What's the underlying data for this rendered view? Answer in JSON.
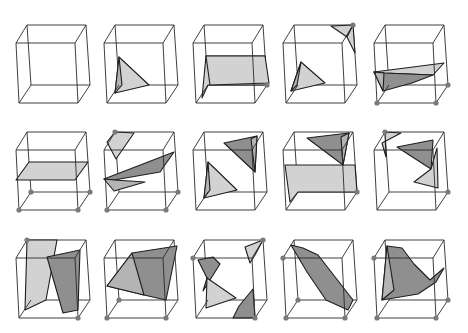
{
  "figure": {
    "rows": 3,
    "cols": 5,
    "colors": {
      "edge": "#2a2a2a",
      "light_fill": "#d2d2d2",
      "mid_fill": "#b4b4b4",
      "dark_fill": "#8f8f8f",
      "vertex_dot": "#7a7a7a",
      "background": "#ffffff"
    },
    "col_x": [
      16,
      104,
      193,
      283,
      374
    ],
    "row_y": [
      25,
      132,
      240
    ],
    "cube_vertices_local": {
      "BTL": [
        11,
        0
      ],
      "BTR": [
        70,
        0
      ],
      "FTL": [
        0,
        18
      ],
      "FTR": [
        59,
        18
      ],
      "BBL": [
        15,
        60
      ],
      "BBR": [
        74,
        60
      ],
      "FBL": [
        3,
        78
      ],
      "FBR": [
        62,
        78
      ]
    },
    "cases": [
      {
        "id": 0,
        "marked": [],
        "polys": []
      },
      {
        "id": 1,
        "marked": [],
        "polys": [
          {
            "shade": "light",
            "pts": [
              [
                15,
                32
              ],
              [
                11,
                68
              ],
              [
                45,
                60
              ]
            ]
          },
          {
            "shade": "mid",
            "pts": [
              [
                15,
                32
              ],
              [
                11,
                68
              ],
              [
                18,
                60
              ]
            ]
          }
        ]
      },
      {
        "id": 2,
        "marked": [
          "BBR"
        ],
        "polys": [
          {
            "shade": "light",
            "pts": [
              [
                13,
                31
              ],
              [
                72,
                31
              ],
              [
                74,
                60
              ],
              [
                15,
                60
              ],
              [
                9,
                73
              ],
              [
                13,
                31
              ]
            ]
          },
          {
            "shade": "light",
            "pts": [
              [
                13,
                31
              ],
              [
                72,
                31
              ],
              [
                76,
                58
              ],
              [
                17,
                60
              ]
            ]
          }
        ]
      },
      {
        "id": 3,
        "marked": [
          "BTR"
        ],
        "polys": [
          {
            "shade": "light",
            "pts": [
              [
                18,
                37
              ],
              [
                8,
                66
              ],
              [
                42,
                58
              ]
            ]
          },
          {
            "shade": "mid",
            "pts": [
              [
                18,
                37
              ],
              [
                8,
                66
              ],
              [
                14,
                60
              ]
            ]
          },
          {
            "shade": "light",
            "pts": [
              [
                48,
                1
              ],
              [
                70,
                0
              ],
              [
                64,
                12
              ]
            ]
          },
          {
            "shade": "light",
            "pts": [
              [
                64,
                12
              ],
              [
                70,
                0
              ],
              [
                72,
                28
              ]
            ]
          }
        ]
      },
      {
        "id": 4,
        "marked": [
          "FBL",
          "FBR",
          "BBR"
        ],
        "polys": [
          {
            "shade": "light",
            "pts": [
              [
                0,
                47
              ],
              [
                70,
                38
              ],
              [
                59,
                50
              ],
              [
                10,
                48
              ]
            ]
          },
          {
            "shade": "dark",
            "pts": [
              [
                0,
                47
              ],
              [
                10,
                48
              ],
              [
                59,
                50
              ],
              [
                38,
                58
              ],
              [
                9,
                66
              ]
            ]
          },
          {
            "shade": "mid",
            "pts": [
              [
                0,
                47
              ],
              [
                10,
                48
              ],
              [
                9,
                66
              ]
            ]
          }
        ]
      },
      {
        "id": 5,
        "marked": [
          "FBL",
          "FBR",
          "BBL",
          "BBR"
        ],
        "polys": [
          {
            "shade": "light",
            "pts": [
              [
                0,
                48
              ],
              [
                13,
                30
              ],
              [
                72,
                30
              ],
              [
                59,
                48
              ]
            ]
          }
        ]
      },
      {
        "id": 6,
        "marked": [
          "BTL",
          "FBL",
          "FBR",
          "BBR"
        ],
        "polys": [
          {
            "shade": "light",
            "pts": [
              [
                11,
                0
              ],
              [
                3,
                10
              ],
              [
                12,
                27
              ],
              [
                30,
                1
              ]
            ]
          },
          {
            "shade": "dark",
            "pts": [
              [
                0,
                47
              ],
              [
                70,
                20
              ],
              [
                56,
                40
              ],
              [
                10,
                48
              ]
            ]
          },
          {
            "shade": "mid",
            "pts": [
              [
                0,
                47
              ],
              [
                10,
                48
              ],
              [
                41,
                50
              ],
              [
                10,
                59
              ]
            ]
          }
        ]
      },
      {
        "id": 7,
        "marked": [],
        "polys": [
          {
            "shade": "light",
            "pts": [
              [
                15,
                30
              ],
              [
                11,
                66
              ],
              [
                44,
                58
              ]
            ]
          },
          {
            "shade": "mid",
            "pts": [
              [
                15,
                30
              ],
              [
                11,
                66
              ],
              [
                17,
                58
              ]
            ]
          },
          {
            "shade": "dark",
            "pts": [
              [
                31,
                11
              ],
              [
                64,
                4
              ],
              [
                62,
                40
              ]
            ]
          },
          {
            "shade": "mid",
            "pts": [
              [
                58,
                7
              ],
              [
                64,
                4
              ],
              [
                62,
                40
              ]
            ]
          }
        ]
      },
      {
        "id": 8,
        "marked": [
          "BBR"
        ],
        "polys": [
          {
            "shade": "light",
            "pts": [
              [
                2,
                33
              ],
              [
                72,
                33
              ],
              [
                74,
                60
              ],
              [
                15,
                60
              ],
              [
                7,
                70
              ]
            ]
          },
          {
            "shade": "dark",
            "pts": [
              [
                24,
                6
              ],
              [
                66,
                1
              ],
              [
                60,
                33
              ]
            ]
          },
          {
            "shade": "mid",
            "pts": [
              [
                58,
                5
              ],
              [
                66,
                1
              ],
              [
                60,
                33
              ]
            ]
          }
        ]
      },
      {
        "id": 9,
        "marked": [
          "BTL",
          "BBR"
        ],
        "polys": [
          {
            "shade": "light",
            "pts": [
              [
                11,
                0
              ],
              [
                27,
                1
              ],
              [
                8,
                11
              ],
              [
                12,
                25
              ]
            ]
          },
          {
            "shade": "dark",
            "pts": [
              [
                23,
                15
              ],
              [
                59,
                8
              ],
              [
                57,
                37
              ]
            ]
          },
          {
            "shade": "light",
            "pts": [
              [
                57,
                37
              ],
              [
                63,
                16
              ],
              [
                64,
                56
              ],
              [
                40,
                50
              ]
            ]
          }
        ]
      },
      {
        "id": 10,
        "marked": [
          "BTL",
          "FBR"
        ],
        "polys": [
          {
            "shade": "light",
            "pts": [
              [
                11,
                0
              ],
              [
                41,
                0
              ],
              [
                30,
                60
              ],
              [
                9,
                70
              ],
              [
                11,
                0
              ]
            ]
          },
          {
            "shade": "dark",
            "pts": [
              [
                31,
                17
              ],
              [
                64,
                10
              ],
              [
                62,
                70
              ],
              [
                47,
                73
              ]
            ]
          }
        ]
      },
      {
        "id": 11,
        "marked": [
          "BBL",
          "FBL",
          "FBR"
        ],
        "polys": [
          {
            "shade": "dark",
            "pts": [
              [
                3,
                46
              ],
              [
                28,
                13
              ],
              [
                73,
                6
              ],
              [
                62,
                60
              ],
              [
                40,
                55
              ]
            ]
          },
          {
            "shade": "mid",
            "pts": [
              [
                3,
                46
              ],
              [
                28,
                13
              ],
              [
                40,
                55
              ]
            ]
          }
        ]
      },
      {
        "id": 12,
        "marked": [
          "BTR",
          "FTL",
          "FBR"
        ],
        "polys": [
          {
            "shade": "dark",
            "pts": [
              [
                5,
                20
              ],
              [
                20,
                17
              ],
              [
                27,
                24
              ],
              [
                10,
                51
              ],
              [
                14,
                38
              ]
            ]
          },
          {
            "shade": "light",
            "pts": [
              [
                52,
                7
              ],
              [
                70,
                0
              ],
              [
                62,
                15
              ],
              [
                57,
                23
              ]
            ]
          },
          {
            "shade": "light",
            "pts": [
              [
                14,
                38
              ],
              [
                13,
                68
              ],
              [
                43,
                58
              ]
            ]
          },
          {
            "shade": "dark",
            "pts": [
              [
                40,
                78
              ],
              [
                62,
                78
              ],
              [
                60,
                49
              ],
              [
                46,
                66
              ]
            ]
          }
        ]
      },
      {
        "id": 13,
        "marked": [
          "FTL",
          "BBL",
          "FBL",
          "FBR"
        ],
        "polys": [
          {
            "shade": "dark",
            "pts": [
              [
                8,
                5
              ],
              [
                20,
                8
              ],
              [
                35,
                15
              ],
              [
                70,
                60
              ],
              [
                65,
                70
              ],
              [
                43,
                60
              ],
              [
                24,
                32
              ]
            ]
          }
        ]
      },
      {
        "id": 14,
        "marked": [
          "FTL",
          "BBR",
          "FBL",
          "FBR"
        ],
        "polys": [
          {
            "shade": "dark",
            "pts": [
              [
                13,
                6
              ],
              [
                28,
                8
              ],
              [
                40,
                24
              ],
              [
                56,
                40
              ],
              [
                70,
                28
              ],
              [
                62,
                42
              ],
              [
                44,
                54
              ],
              [
                8,
                60
              ]
            ]
          },
          {
            "shade": "mid",
            "pts": [
              [
                13,
                6
              ],
              [
                8,
                60
              ],
              [
                20,
                50
              ]
            ]
          }
        ]
      }
    ]
  }
}
